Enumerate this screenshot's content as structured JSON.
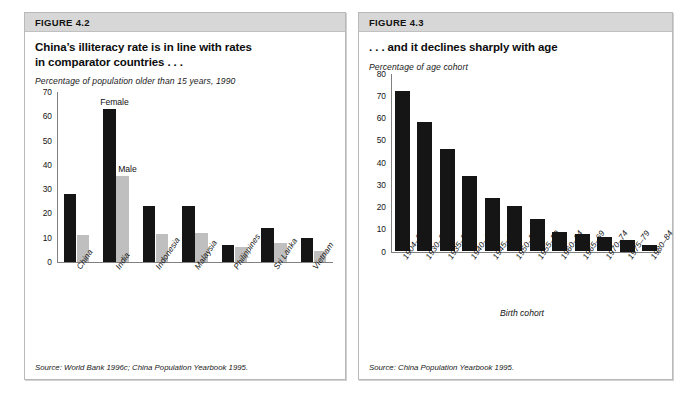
{
  "figure_left": {
    "band_label": "FIGURE 4.2",
    "title_line1": "China’s illiteracy rate is in line with rates",
    "title_line2": "in comparator countries . . .",
    "subtitle": "Percentage of population older than 15 years, 1990",
    "source": "Source: World Bank 1996c; China Population Yearbook 1995.",
    "annotation_female": "Female",
    "annotation_male": "Male",
    "colors": {
      "female_bar": "#151515",
      "male_bar": "#bfbfbf",
      "axis": "#808080",
      "band": "#d7d7d7"
    }
  },
  "figure_right": {
    "band_label": "FIGURE 4.3",
    "title_line1": ". . . and it declines sharply with age",
    "subtitle": "Percentage of age cohort",
    "xaxis_caption": "Birth cohort",
    "source": "Source: China Population Yearbook 1995.",
    "colors": {
      "bar": "#151515",
      "axis": "#808080",
      "band": "#d7d7d7"
    }
  },
  "chart_data": [
    {
      "type": "bar",
      "title": "China’s illiteracy rate is in line with rates in comparator countries . . .",
      "subtitle": "Percentage of population older than 15 years, 1990",
      "xlabel": "",
      "ylabel": "Percentage of population older than 15 years, 1990",
      "ylim": [
        0,
        70
      ],
      "yticks": [
        0,
        10,
        20,
        30,
        40,
        50,
        60,
        70
      ],
      "grid": false,
      "legend": [
        "Female",
        "Male"
      ],
      "legend_position": "inline-annotation",
      "categories": [
        "China",
        "India",
        "Indonesia",
        "Malaysia",
        "Philippines",
        "Sri Lanka",
        "Vietnam"
      ],
      "series": [
        {
          "name": "Female",
          "values": [
            28,
            63,
            23,
            23,
            6.8,
            14,
            10
          ]
        },
        {
          "name": "Male",
          "values": [
            11,
            35.5,
            11.5,
            12,
            6,
            8,
            4.5
          ]
        }
      ],
      "source": "Source: World Bank 1996c; China Population Yearbook 1995."
    },
    {
      "type": "bar",
      "title": ". . . and it declines sharply with age",
      "subtitle": "Percentage of age cohort",
      "xlabel": "Birth cohort",
      "ylabel": "Percentage of age cohort",
      "ylim": [
        0,
        80
      ],
      "yticks": [
        0,
        10,
        20,
        30,
        40,
        50,
        60,
        70,
        80
      ],
      "grid": false,
      "categories": [
        "1904–29",
        "1930–34",
        "1935–39",
        "1940–44",
        "1945–49",
        "1950–54",
        "1955–59",
        "1960–64",
        "1965–69",
        "1970–74",
        "1975–79",
        "1980–84"
      ],
      "values": [
        72,
        58,
        46,
        34,
        24,
        20.5,
        14.5,
        8.8,
        7.7,
        6.5,
        5,
        3
      ],
      "series": [
        {
          "name": "Illiteracy rate",
          "values": [
            72,
            58,
            46,
            34,
            24,
            20.5,
            14.5,
            8.8,
            7.7,
            6.5,
            5,
            3
          ]
        }
      ],
      "source": "Source: China Population Yearbook 1995."
    }
  ]
}
